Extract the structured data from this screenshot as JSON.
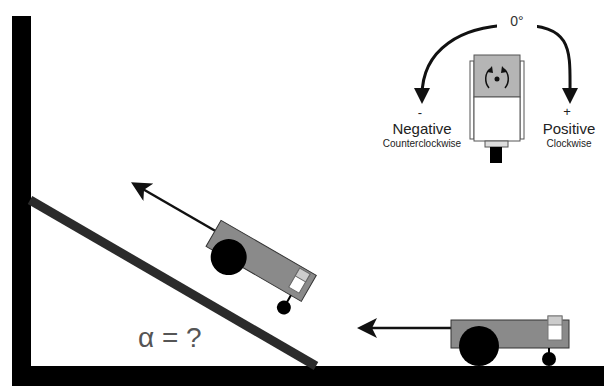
{
  "diagram": {
    "title_hint": "Robot on an incline with servo rotation direction legend",
    "servo_legend": {
      "zero_label": "0°",
      "negative": {
        "sign": "-",
        "label": "Negative",
        "sublabel": "Counterclockwise"
      },
      "positive": {
        "sign": "+",
        "label": "Positive",
        "sublabel": "Clockwise"
      }
    },
    "incline": {
      "angle_label": "α = ?"
    },
    "robots": [
      {
        "name": "robot-on-incline",
        "direction": "up-left along incline"
      },
      {
        "name": "robot-on-floor",
        "direction": "left"
      }
    ],
    "colors": {
      "frame": "#000000",
      "ramp": "#2b2b2b",
      "robot_body": "#8a8a8a",
      "wheel": "#000000",
      "servo_top": "#b5b5b5",
      "servo_body": "#ffffff",
      "text": "#222222"
    }
  }
}
